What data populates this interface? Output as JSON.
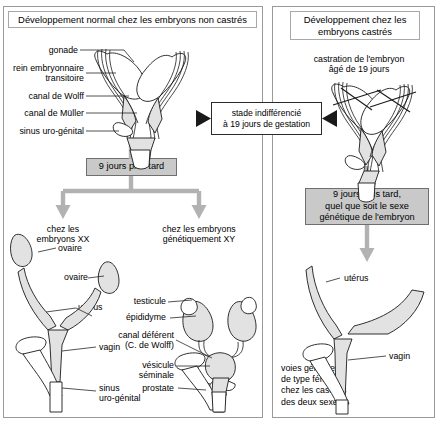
{
  "diagram": {
    "language": "fr",
    "left_panel": {
      "title": "Développement normal chez les embryons non castrés",
      "stage_labels": [
        "gonade",
        "rein embryonnaire\ntransitoire",
        "canal de Wolff",
        "canal de Müller",
        "sinus uro-génital"
      ],
      "step_box": "9 jours plus tard",
      "branch_left": "chez les\nembryons XX",
      "branch_right": "chez les embryons\ngénétiquement XY",
      "female_labels": [
        "ovaire",
        "ovaire",
        "utérus",
        "vagin",
        "sinus\nuro-génital"
      ],
      "male_labels": [
        "testicule",
        "épididyme",
        "canal déférent\n(C. de Wolff)",
        "vésicule\nséminale",
        "prostate"
      ]
    },
    "center_box": "stade indifférencié\nà 19 jours de gestation",
    "right_panel": {
      "title": "Développement chez les\nembryons castrés",
      "caption": "castration de l'embryon\nâgé de 19 jours",
      "step_box": "9 jours plus tard,\nquel que soit le sexe\ngénétique de l'embryon",
      "labels": [
        "utérus",
        "vagin"
      ],
      "conclusion": "voies génitales\nde type féminin\nchez les castrats\ndes deux sexes"
    },
    "colors": {
      "panel_border": "#9a9a9a",
      "gray_box_fill": "#c9c9c9",
      "gray_box_border": "#6f6f6f",
      "arrow_gray": "#b2b2b2",
      "organ_fill": "#e2e2e2",
      "ink": "#1a1a1a"
    }
  }
}
